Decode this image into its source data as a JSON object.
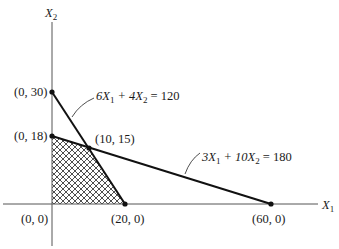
{
  "diagram": {
    "type": "linear-programming-feasible-region",
    "axes": {
      "x_label": "X",
      "x_label_sub": "1",
      "y_label": "X",
      "y_label_sub": "2"
    },
    "constraints": [
      {
        "id": "c1",
        "equation_parts": [
          "6X",
          "1",
          " + 4X",
          "2",
          " = 120"
        ],
        "equation": "6X1 + 4X2 = 120",
        "intercepts": [
          [
            0,
            30
          ],
          [
            20,
            0
          ]
        ]
      },
      {
        "id": "c2",
        "equation_parts": [
          "3X",
          "1",
          " + 10X",
          "2",
          " = 180"
        ],
        "equation": "3X1 + 10X2 = 180",
        "intercepts": [
          [
            0,
            18
          ],
          [
            60,
            0
          ]
        ]
      }
    ],
    "points": [
      {
        "label": "(0, 30)",
        "x": 0,
        "y": 30
      },
      {
        "label": "(0, 18)",
        "x": 0,
        "y": 18
      },
      {
        "label": "(10, 15)",
        "x": 10,
        "y": 15
      },
      {
        "label": "(0, 0)",
        "x": 0,
        "y": 0
      },
      {
        "label": "(20, 0)",
        "x": 20,
        "y": 0
      },
      {
        "label": "(60, 0)",
        "x": 60,
        "y": 0
      }
    ],
    "feasible_region": {
      "vertices": [
        [
          0,
          0
        ],
        [
          0,
          18
        ],
        [
          10,
          15
        ],
        [
          20,
          0
        ]
      ],
      "fill": "crosshatch"
    },
    "colors": {
      "line": "#111111",
      "axis": "#555555",
      "hatch": "#222222",
      "background": "#ffffff"
    }
  }
}
